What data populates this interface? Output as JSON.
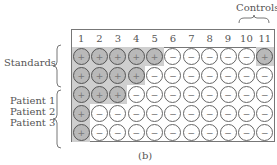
{
  "figure": {
    "caption": "(b)",
    "controls_label": "Controls",
    "standards_label": "Standards",
    "patient_labels": [
      "Patient 1",
      "Patient 2",
      "Patient 3"
    ],
    "columns": [
      "1",
      "2",
      "3",
      "4",
      "5",
      "6",
      "7",
      "8",
      "9",
      "10",
      "11"
    ],
    "wells": [
      [
        "+",
        "+",
        "+",
        "+",
        "+",
        "−",
        "−",
        "−",
        "−",
        "−",
        "+"
      ],
      [
        "+",
        "+",
        "+",
        "+",
        "−",
        "−",
        "−",
        "−",
        "−",
        "−",
        "−"
      ],
      [
        "+",
        "+",
        "+",
        "−",
        "−",
        "−",
        "−",
        "−",
        "−",
        "−",
        "−"
      ],
      [
        "+",
        "−",
        "−",
        "−",
        "−",
        "−",
        "−",
        "−",
        "−",
        "−",
        "−"
      ],
      [
        "+",
        "−",
        "−",
        "−",
        "−",
        "−",
        "−",
        "−",
        "−",
        "−",
        "−"
      ]
    ],
    "colors": {
      "positive_fill": "#b9b9b9",
      "negative_fill": "#ffffff",
      "outline": "#666666"
    }
  }
}
